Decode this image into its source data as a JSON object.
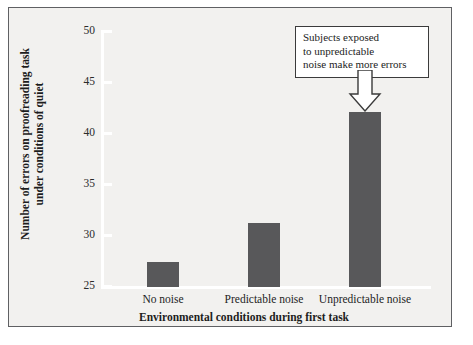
{
  "chart_data": {
    "type": "bar",
    "title": "",
    "categories": [
      "No noise",
      "Predictable noise",
      "Unpredictable noise"
    ],
    "values": [
      27.5,
      31.3,
      42.2
    ],
    "xlabel": "Environmental conditions during first task",
    "ylabel": "Number of errors on proofreading task under conditions of quiet",
    "ylabel_line1": "Number of errors on proofreading task",
    "ylabel_line2": "under conditions of quiet",
    "ylim": [
      25,
      50
    ],
    "ytick_values": [
      25,
      30,
      35,
      40,
      45,
      50
    ],
    "ytick_labels": [
      "25",
      "30",
      "35",
      "40",
      "45",
      "50"
    ],
    "grid": false,
    "legend": false,
    "bar_color": "#58585a",
    "plot_background": "#f2f1ef",
    "axis_color": "#ffffff",
    "annotations": [
      {
        "line1": "Subjects exposed",
        "line2": "to unpredictable",
        "line3": "noise make more errors",
        "points_to": "Unpredictable noise"
      }
    ]
  },
  "figure": {
    "frame_color": "#5f6063",
    "page_background": "#ffffff"
  }
}
